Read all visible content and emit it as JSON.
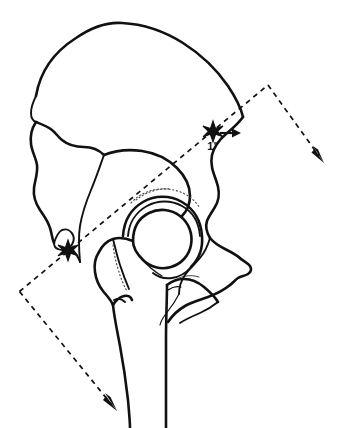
{
  "figure": {
    "background_color": "#ffffff",
    "line_color": "#111111",
    "width": 337,
    "height": 428
  },
  "annotations": {
    "dimension_label": "1\"",
    "dimension_meaning": "one inch displacement",
    "landmark_marker_glyph": "*",
    "landmarks": [
      {
        "name": "posterior-superior-landmark",
        "glyph": "*",
        "x": 213,
        "y": 131
      },
      {
        "name": "inferior-pubic-landmark",
        "glyph": "*",
        "x": 68,
        "y": 250
      }
    ],
    "measure_arrow": {
      "name": "one-inch-offset-arrow",
      "direction": "right",
      "from_x": 220,
      "from_y": 133,
      "to_x": 239,
      "to_y": 133
    },
    "axis": {
      "name": "reference-axis",
      "style": "dashed",
      "description": "dashed reference line running from lower-left through pelvis to upper-right, with directional arrowheads at both ends"
    },
    "axis_arrowheads": [
      {
        "name": "upper-right-arrowhead",
        "tip_x": 324,
        "tip_y": 162,
        "direction": "down-right"
      },
      {
        "name": "lower-left-arrowhead",
        "tip_x": 117,
        "tip_y": 410,
        "direction": "down-right"
      }
    ]
  },
  "structures": [
    {
      "name": "iliac-crest",
      "label": "Iliac crest"
    },
    {
      "name": "iliac-wing",
      "label": "Iliac wing"
    },
    {
      "name": "anterior-superior-iliac-spine",
      "label": "Anterior superior iliac spine"
    },
    {
      "name": "anterior-inferior-iliac-spine",
      "label": "Anterior inferior iliac spine"
    },
    {
      "name": "pubis",
      "label": "Pubis"
    },
    {
      "name": "acetabulum",
      "label": "Acetabulum"
    },
    {
      "name": "femoral-head",
      "label": "Femoral head"
    },
    {
      "name": "femoral-neck",
      "label": "Femoral neck"
    },
    {
      "name": "greater-trochanter",
      "label": "Greater trochanter"
    },
    {
      "name": "lesser-trochanter",
      "label": "Lesser trochanter"
    },
    {
      "name": "femoral-shaft",
      "label": "Femoral shaft"
    },
    {
      "name": "ischial-tuberosity",
      "label": "Ischial tuberosity"
    },
    {
      "name": "ischial-spine",
      "label": "Ischial spine"
    },
    {
      "name": "greater-sciatic-notch",
      "label": "Greater sciatic notch"
    },
    {
      "name": "acetabular-roof-stipple",
      "label": "Acetabular roof stippling"
    }
  ]
}
